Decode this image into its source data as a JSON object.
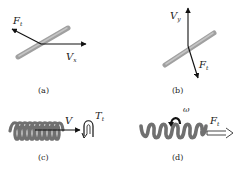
{
  "figure": {
    "panels": [
      {
        "id": "a",
        "caption": "(a)",
        "object": "rod",
        "vectors": [
          {
            "label_main": "V",
            "label_sub": "x",
            "direction": "right"
          },
          {
            "label_main": "F",
            "label_sub": "t",
            "direction": "up-left"
          }
        ]
      },
      {
        "id": "b",
        "caption": "(b)",
        "object": "rod",
        "vectors": [
          {
            "label_main": "V",
            "label_sub": "y",
            "direction": "up"
          },
          {
            "label_main": "F",
            "label_sub": "t",
            "direction": "down-right"
          }
        ]
      },
      {
        "id": "c",
        "caption": "(c)",
        "object": "helix",
        "vectors": [
          {
            "label_main": "V",
            "label_sub": "",
            "direction": "right"
          },
          {
            "label_main": "T",
            "label_sub": "t",
            "type": "torque"
          }
        ]
      },
      {
        "id": "d",
        "caption": "(d)",
        "object": "helix",
        "vectors": [
          {
            "label_main": "ω",
            "label_sub": "",
            "type": "rotation"
          },
          {
            "label_main": "F",
            "label_sub": "t",
            "direction": "right",
            "style": "hollow"
          }
        ]
      }
    ],
    "colors": {
      "rod": "#9a9a9a",
      "helix": "#6f6f6f",
      "arrow": "#111111",
      "text": "#1a1a1a"
    }
  }
}
